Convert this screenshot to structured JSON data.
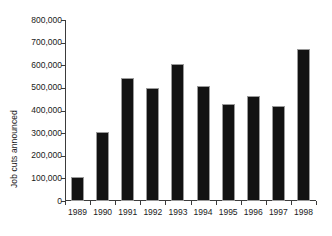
{
  "chart_data": {
    "type": "bar",
    "title": "",
    "subtitle": "",
    "xlabel": "",
    "ylabel": "Job cuts announced",
    "categories": [
      "1989",
      "1990",
      "1991",
      "1992",
      "1993",
      "1994",
      "1995",
      "1996",
      "1997",
      "1998"
    ],
    "values": [
      107000,
      307000,
      545000,
      498000,
      605000,
      507000,
      427000,
      463000,
      418000,
      673000
    ],
    "ylim": [
      0,
      800000
    ],
    "ytick_values": [
      0,
      100000,
      200000,
      300000,
      400000,
      500000,
      600000,
      700000,
      800000
    ],
    "ytick_labels": [
      "0",
      "100,000",
      "200,000",
      "300,000",
      "400,000",
      "500,000",
      "600,000",
      "700,000",
      "800,000"
    ],
    "grid": false,
    "legend": null,
    "legend_position": "none",
    "bar_color": "#121212",
    "bar_edge_color": "#9a9a9a",
    "axis_color": "#3b3b3b",
    "background_color": "#ffffff",
    "annotations": []
  }
}
